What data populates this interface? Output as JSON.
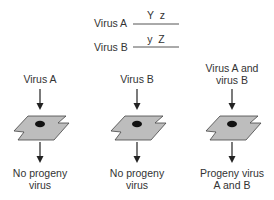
{
  "genotypes": [
    {
      "label": "Virus A",
      "alleles": "Y  z"
    },
    {
      "label": "Virus B",
      "alleles": "y  Z"
    }
  ],
  "columns": [
    {
      "input_line1": "Virus A",
      "input_line2": "",
      "result_line1": "No progeny",
      "result_line2": "virus"
    },
    {
      "input_line1": "Virus B",
      "input_line2": "",
      "result_line1": "No progeny",
      "result_line2": "virus"
    },
    {
      "input_line1": "Virus A and",
      "input_line2": "virus B",
      "result_line1": "Progeny virus",
      "result_line2": "A and B"
    }
  ],
  "colors": {
    "cell_fill": "#bdbdbd",
    "outline": "#444444",
    "nucleus": "#111111",
    "text": "#333333"
  }
}
